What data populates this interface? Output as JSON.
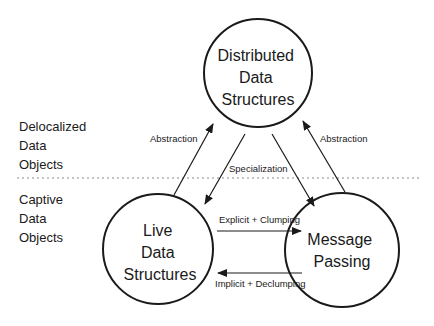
{
  "diagram": {
    "nodes": [
      {
        "id": "distributed",
        "lines": [
          "Distributed",
          "Data",
          "Structures"
        ]
      },
      {
        "id": "live",
        "lines": [
          "Live",
          "Data",
          "Structures"
        ]
      },
      {
        "id": "message",
        "lines": [
          "Message",
          "Passing"
        ]
      }
    ],
    "regions": [
      {
        "id": "delocalized",
        "lines": [
          "Delocalized",
          "Data",
          "Objects"
        ]
      },
      {
        "id": "captive",
        "lines": [
          "Captive",
          "Data",
          "Objects"
        ]
      }
    ],
    "edges": [
      {
        "from": "live",
        "to": "distributed",
        "label": "Abstraction"
      },
      {
        "from": "distributed",
        "to": "live",
        "label": "Specialization"
      },
      {
        "from": "distributed",
        "to": "message",
        "label": ""
      },
      {
        "from": "message",
        "to": "distributed",
        "label": "Abstraction"
      },
      {
        "from": "live",
        "to": "message",
        "label": "Explicit + Clumping"
      },
      {
        "from": "message",
        "to": "live",
        "label": "Implicit + Declumping"
      }
    ],
    "colors": {
      "stroke": "#1a1a1a",
      "divider": "#888888",
      "background": "#ffffff"
    }
  }
}
